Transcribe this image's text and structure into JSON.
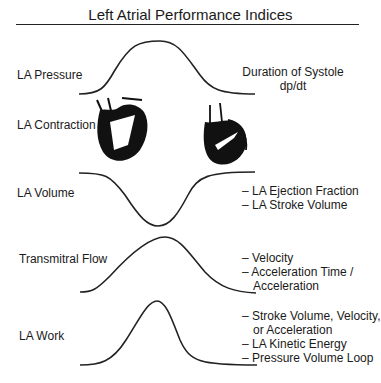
{
  "title": "Left Atrial Performance Indices",
  "rows": [
    {
      "label": "LA Pressure",
      "curve": "peak",
      "notes": [
        "Duration of Systole",
        "dp/dt"
      ]
    },
    {
      "label": "LA Contraction",
      "curve": "heart-illustrations",
      "notes": []
    },
    {
      "label": "LA Volume",
      "curve": "trough",
      "notes": [
        "– LA Ejection Fraction",
        "– LA Stroke Volume"
      ]
    },
    {
      "label": "Transmitral Flow",
      "curve": "peak",
      "notes": [
        "– Velocity",
        "– Acceleration Time /",
        "Acceleration"
      ]
    },
    {
      "label": "LA Work",
      "curve": "sharp-peak",
      "notes": [
        "– Stroke Volume, Velocity,",
        "or Acceleration",
        "– LA Kinetic Energy",
        "– Pressure Volume Loop"
      ]
    }
  ]
}
